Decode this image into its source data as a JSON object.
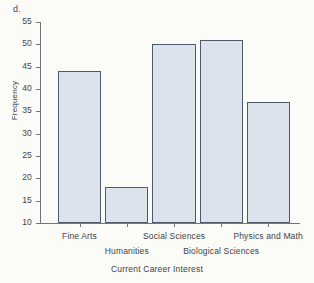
{
  "panel": {
    "letter": "d."
  },
  "chart_data": {
    "type": "bar",
    "title": "",
    "xlabel": "Current Career Interest",
    "ylabel": "Frequency",
    "categories": [
      "Fine Arts",
      "Humanities",
      "Social Sciences",
      "Biological Sciences",
      "Physics and Math"
    ],
    "values": [
      44,
      18,
      50,
      51,
      37
    ],
    "ylim": [
      10,
      55
    ],
    "yticks": [
      10,
      15,
      20,
      25,
      30,
      35,
      40,
      45,
      50,
      55
    ],
    "ytick_labels": [
      "10",
      "15",
      "20",
      "25",
      "30",
      "35",
      "40",
      "45",
      "50",
      "55"
    ],
    "grid": false,
    "legend": false,
    "bar_fill_color": "#dde3ed",
    "bar_edge_color": "#4e5a6b",
    "axis_color": "#6f7680",
    "background_color": "#fbfbf8",
    "label_rows": [
      {
        "row": 0,
        "labels": [
          "Fine Arts",
          "Social Sciences",
          "Physics and Math"
        ],
        "indices": [
          0,
          2,
          4
        ]
      },
      {
        "row": 1,
        "labels": [
          "Humanities",
          "Biological Sciences"
        ],
        "indices": [
          1,
          3
        ]
      }
    ]
  }
}
